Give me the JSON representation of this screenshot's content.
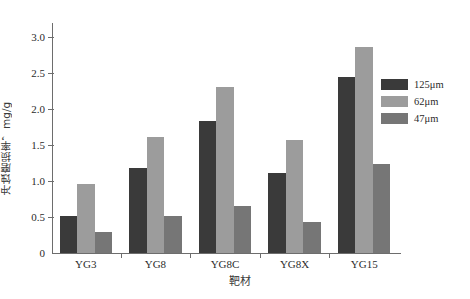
{
  "chart_data": {
    "type": "bar",
    "title": "",
    "xlabel": "靶材",
    "ylabel": "冲蚀磨损率，mg/g",
    "categories": [
      "YG3",
      "YG8",
      "YG8C",
      "YG8X",
      "YG15"
    ],
    "series": [
      {
        "name": "125μm",
        "color": "#3a3a3a",
        "values": [
          0.52,
          1.18,
          1.83,
          1.11,
          2.45
        ]
      },
      {
        "name": "62μm",
        "color": "#9c9c9c",
        "values": [
          0.96,
          1.61,
          2.31,
          1.57,
          2.87
        ]
      },
      {
        "name": "47μm",
        "color": "#767676",
        "values": [
          0.29,
          0.51,
          0.65,
          0.43,
          1.24
        ]
      }
    ],
    "ylim": [
      0,
      3.2
    ],
    "yticks": [
      0,
      0.5,
      1.0,
      1.5,
      2.0,
      2.5,
      3.0
    ],
    "ytick_labels": [
      "0",
      "0.5",
      "1.0",
      "1.5",
      "2.0",
      "2.5",
      "3.0"
    ],
    "grid": false,
    "legend_position": "right"
  },
  "axis": {
    "line_color": "#6d6d6d"
  }
}
